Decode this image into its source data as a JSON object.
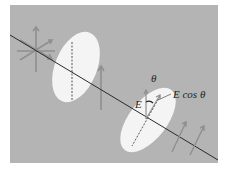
{
  "diagram": {
    "type": "polarization-analyzer",
    "background_color": "#b4b4b4",
    "disk_color": "#f4f4f4",
    "line_color": "#2a2a2a",
    "arrow_color": "#8c8c8c",
    "labels": {
      "theta": "θ",
      "e_field": "E",
      "e_cos_theta": "E cos θ"
    }
  }
}
